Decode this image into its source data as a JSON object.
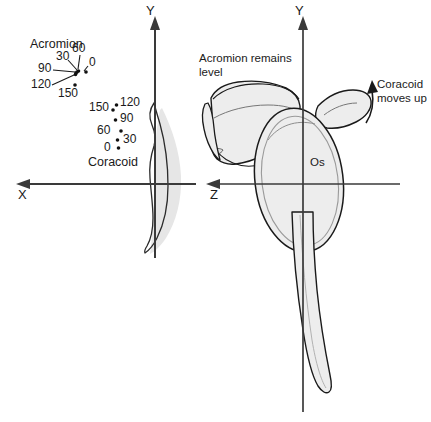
{
  "figure": {
    "title_text": "",
    "colors": {
      "bone_fill": "#ededed",
      "bone_fill_light": "#f2f2f2",
      "bone_outline": "#1a1a1a",
      "shadow_fill": "#e3e3e3",
      "axis": "#3a3a3a",
      "text": "#1a1a1a",
      "marker": "#111111"
    }
  },
  "left_panel": {
    "name": "x-y-plane-marker-plot",
    "axes": {
      "vertical_label": "Y",
      "horizontal_label": "X"
    },
    "acromion": {
      "label": "Acromion",
      "angles": [
        "0",
        "30",
        "60",
        "90",
        "120",
        "150"
      ],
      "points": [
        {
          "angle": "0",
          "x": 86,
          "y": 72
        },
        {
          "angle": "30",
          "x": 78,
          "y": 71
        },
        {
          "angle": "60",
          "x": 77,
          "y": 72
        },
        {
          "angle": "90",
          "x": 76,
          "y": 73
        },
        {
          "angle": "120",
          "x": 76,
          "y": 74
        },
        {
          "angle": "150",
          "x": 75,
          "y": 85
        }
      ],
      "label_positions": [
        {
          "angle": "0",
          "x": 89,
          "y": 62
        },
        {
          "angle": "30",
          "x": 56,
          "y": 56
        },
        {
          "angle": "60",
          "x": 73,
          "y": 49
        },
        {
          "angle": "90",
          "x": 40,
          "y": 66
        },
        {
          "angle": "120",
          "x": 34,
          "y": 83
        },
        {
          "angle": "150",
          "x": 59,
          "y": 92
        }
      ]
    },
    "coracoid": {
      "label": "Coracoid",
      "angles": [
        "0",
        "30",
        "60",
        "90",
        "120",
        "150"
      ],
      "points": [
        {
          "angle": "0",
          "x": 119,
          "y": 148
        },
        {
          "angle": "30",
          "x": 118,
          "y": 140
        },
        {
          "angle": "60",
          "x": 121,
          "y": 131
        },
        {
          "angle": "90",
          "x": 116,
          "y": 120
        },
        {
          "angle": "120",
          "x": 117,
          "y": 105
        },
        {
          "angle": "150",
          "x": 113,
          "y": 110
        }
      ],
      "label_positions": [
        {
          "angle": "0",
          "x": 104,
          "y": 143
        },
        {
          "angle": "30",
          "x": 122,
          "y": 135
        },
        {
          "angle": "60",
          "x": 98,
          "y": 125
        },
        {
          "angle": "90",
          "x": 120,
          "y": 114
        },
        {
          "angle": "120",
          "x": 120,
          "y": 99
        },
        {
          "angle": "150",
          "x": 92,
          "y": 105
        }
      ],
      "caption_position": {
        "x": 88,
        "y": 156
      }
    }
  },
  "right_panel": {
    "name": "z-y-plane-scapula-view",
    "axes": {
      "vertical_label": "Y",
      "horizontal_label": "Z"
    },
    "origin_label": "Os",
    "annotations": [
      {
        "name": "acromion-annotation",
        "line1": "Acromion remains",
        "line2": "level",
        "x": 199,
        "y": 52
      },
      {
        "name": "coracoid-annotation",
        "line1": "Coracoid",
        "line2": "moves up",
        "x": 377,
        "y": 78
      }
    ]
  }
}
